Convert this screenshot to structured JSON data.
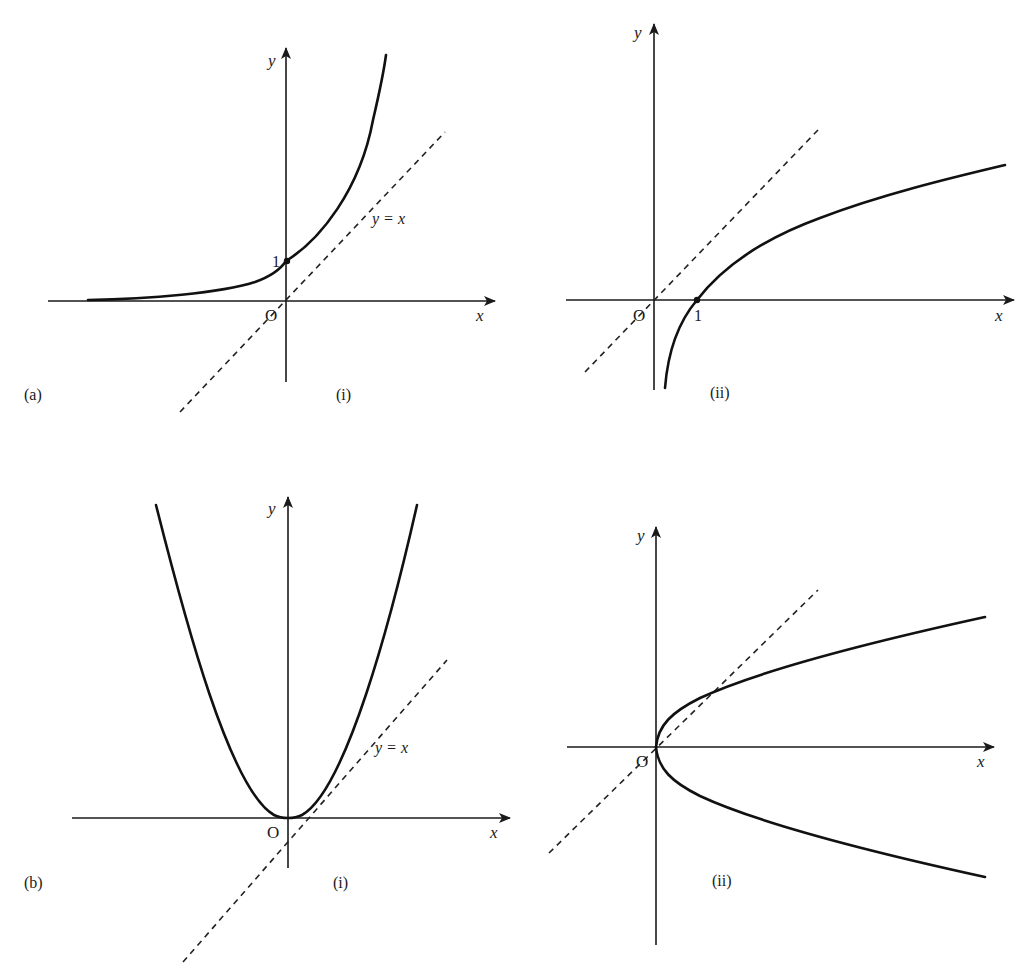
{
  "figure": {
    "panels": [
      {
        "id": "a-i",
        "part_label": "(a)",
        "sub_label": "(i)",
        "curve": "exponential y = e^x (increasing, passes through (0,1))",
        "axis_labels": {
          "x": "x",
          "y": "y",
          "origin": "O"
        },
        "marked_point_label": "1",
        "line_label": "y = x"
      },
      {
        "id": "a-ii",
        "part_label": "",
        "sub_label": "(ii)",
        "curve": "logarithmic y = ln x (passes through (1,0))",
        "axis_labels": {
          "x": "x",
          "y": "y",
          "origin": "O"
        },
        "marked_point_label": "1",
        "line_label": ""
      },
      {
        "id": "b-i",
        "part_label": "(b)",
        "sub_label": "(i)",
        "curve": "parabola y = x^2 (vertex at origin)",
        "axis_labels": {
          "x": "x",
          "y": "y",
          "origin": "O"
        },
        "marked_point_label": "",
        "line_label": "y = x"
      },
      {
        "id": "b-ii",
        "part_label": "",
        "sub_label": "(ii)",
        "curve": "sideways parabola x = y^2 (vertex at origin)",
        "axis_labels": {
          "x": "x",
          "y": "y",
          "origin": "O"
        },
        "marked_point_label": "",
        "line_label": ""
      }
    ]
  },
  "colors": {
    "ink": "#1a1a1a",
    "background": "#ffffff"
  }
}
